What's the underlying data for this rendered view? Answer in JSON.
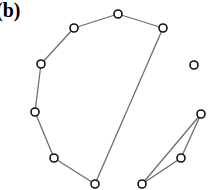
{
  "panel_label": "(b)",
  "graph": {
    "node_radius": 4,
    "colors": {
      "edge": "#6e6e6e",
      "node_stroke": "#111111",
      "node_fill": "#ffffff",
      "background": "#ffffff"
    },
    "nodes": [
      {
        "id": "A",
        "x": 41,
        "y": 64
      },
      {
        "id": "B",
        "x": 74,
        "y": 28
      },
      {
        "id": "C",
        "x": 118,
        "y": 14
      },
      {
        "id": "D",
        "x": 163,
        "y": 28
      },
      {
        "id": "E",
        "x": 194,
        "y": 65
      },
      {
        "id": "F",
        "x": 35,
        "y": 112
      },
      {
        "id": "G",
        "x": 54,
        "y": 158
      },
      {
        "id": "H",
        "x": 95,
        "y": 184
      },
      {
        "id": "I",
        "x": 201,
        "y": 114
      },
      {
        "id": "J",
        "x": 181,
        "y": 158
      },
      {
        "id": "K",
        "x": 142,
        "y": 184
      }
    ],
    "edges": [
      [
        "A",
        "B"
      ],
      [
        "B",
        "C"
      ],
      [
        "C",
        "D"
      ],
      [
        "D",
        "H"
      ],
      [
        "A",
        "F"
      ],
      [
        "F",
        "G"
      ],
      [
        "G",
        "H"
      ],
      [
        "I",
        "J"
      ],
      [
        "J",
        "K"
      ],
      [
        "K",
        "I"
      ]
    ]
  }
}
